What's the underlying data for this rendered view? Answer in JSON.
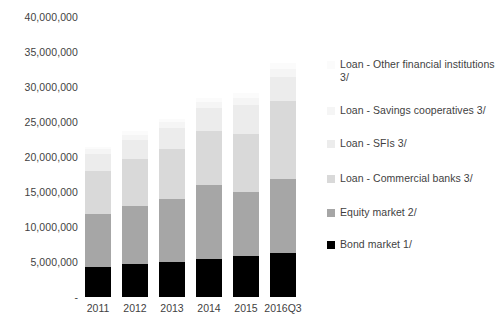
{
  "chart_data": {
    "type": "bar",
    "title": "",
    "subtitle": "",
    "xlabel": "",
    "ylabel": "",
    "stacked": true,
    "orientation": "vertical",
    "grid": false,
    "legend_position": "right",
    "categories": [
      "2011",
      "2012",
      "2013",
      "2014",
      "2015",
      "2016Q3"
    ],
    "ylim": [
      0,
      40000000
    ],
    "yticks": [
      0,
      5000000,
      10000000,
      15000000,
      20000000,
      25000000,
      30000000,
      35000000,
      40000000
    ],
    "ytick_labels": [
      "-",
      "5,000,000",
      "10,000,000",
      "15,000,000",
      "20,000,000",
      "25,000,000",
      "30,000,000",
      "35,000,000",
      "40,000,000"
    ],
    "series": [
      {
        "name": "Bond market 1/",
        "color": "#000000",
        "values": [
          4300000,
          4700000,
          5000000,
          5400000,
          5800000,
          6300000
        ]
      },
      {
        "name": "Equity market 2/",
        "color": "#a6a6a6",
        "values": [
          7500000,
          8300000,
          9000000,
          10600000,
          9200000,
          10500000
        ]
      },
      {
        "name": "Loan - Commercial banks 3/",
        "color": "#d9d9d9",
        "values": [
          6200000,
          6700000,
          7200000,
          7700000,
          8300000,
          11200000
        ]
      },
      {
        "name": "Loan - SFIs 3/",
        "color": "#ececec",
        "values": [
          2500000,
          2800000,
          3000000,
          3300000,
          4100000,
          3500000
        ]
      },
      {
        "name": "Loan - Savings cooperatives 3/",
        "color": "#f5f5f5",
        "values": [
          600000,
          700000,
          800000,
          900000,
          1000000,
          1100000
        ]
      },
      {
        "name": "Loan - Other financial institutions 3/",
        "color": "#fbfbfb",
        "values": [
          400000,
          500000,
          500000,
          600000,
          700000,
          800000
        ]
      }
    ],
    "totals": [
      21500000,
      23700000,
      25500000,
      28500000,
      29100000,
      33400000
    ]
  },
  "legend": {
    "items": [
      {
        "label": "Loan - Other financial institutions 3/",
        "swatch": "#fbfbfb"
      },
      {
        "label": "Loan - Savings cooperatives 3/",
        "swatch": "#f5f5f5"
      },
      {
        "label": "Loan - SFIs 3/",
        "swatch": "#ececec"
      },
      {
        "label": "Loan - Commercial banks 3/",
        "swatch": "#d9d9d9"
      },
      {
        "label": "Equity market 2/",
        "swatch": "#a6a6a6"
      },
      {
        "label": "Bond market 1/",
        "swatch": "#000000"
      }
    ]
  },
  "axis": {
    "y_labels": [
      {
        "text": "40,000,000",
        "value": 40000000
      },
      {
        "text": "35,000,000",
        "value": 35000000
      },
      {
        "text": "30,000,000",
        "value": 30000000
      },
      {
        "text": "25,000,000",
        "value": 25000000
      },
      {
        "text": "20,000,000",
        "value": 20000000
      },
      {
        "text": "15,000,000",
        "value": 15000000
      },
      {
        "text": "10,000,000",
        "value": 10000000
      },
      {
        "text": "5,000,000",
        "value": 5000000
      },
      {
        "text": "-",
        "value": 0
      }
    ]
  }
}
